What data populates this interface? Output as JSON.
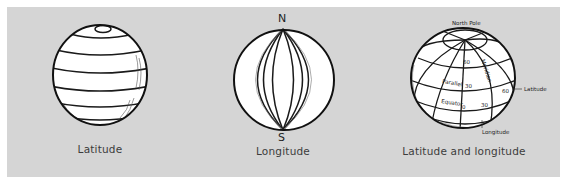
{
  "figures": [
    {
      "id": "latitude",
      "caption": "Latitude"
    },
    {
      "id": "longitude",
      "caption": "Longitude",
      "north_label": "N",
      "south_label": "S"
    },
    {
      "id": "latitude-and-longitude",
      "caption": "Latitude and longitude",
      "labels": {
        "north_pole": "North Pole",
        "meridian": "Meridian",
        "parallel": "Parallel",
        "equator": "Equator",
        "lat_60": "60",
        "lat_30": "30",
        "lat_0": "0",
        "lon_30": "30",
        "lon_60": "60",
        "latitude_callout": "Latitude",
        "longitude_callout": "Longitude"
      }
    }
  ],
  "colors": {
    "panel_bg": "#d5d5d5",
    "globe_fill": "#ffffff",
    "line": "#1a1a1a",
    "caption": "#3c3c3c"
  }
}
